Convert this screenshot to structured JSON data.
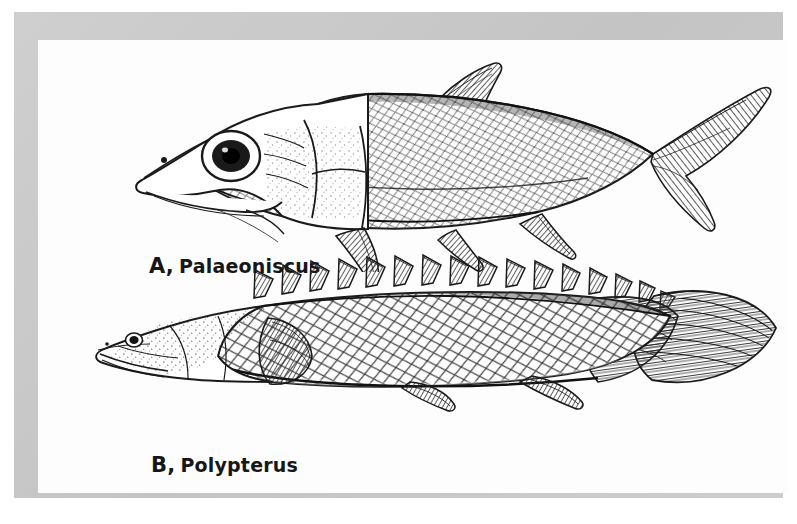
{
  "plate": {
    "background_color": "#ffffff",
    "frame_color": "#c9c9c9",
    "field_color": "#fdfdfd",
    "ink_color": "#1a1a1a"
  },
  "figures": [
    {
      "id": "A",
      "letter": "A,",
      "name": "Palaeoniscus",
      "caption": "A, Palaeoniscus",
      "description": "fusiform fossil palaeoniscoid ray-finned fish in left lateral view, heavy bony head plates, large eye, diagonal rows of rhombic ganoid scales, single pointed triangular dorsal fin, deeply forked heterocercal tail",
      "fins": [
        "pectoral-fin",
        "pelvic-fin",
        "anal-fin",
        "dorsal-fin",
        "caudal-fin"
      ]
    },
    {
      "id": "B",
      "letter": "B,",
      "name": "Polypterus",
      "caption": "B, Polypterus",
      "description": "elongate bichir in left lateral view, small eye, rhombic ganoid scales, row of about sixteen separate triangular dorsal finlets, rounded lobed caudal fin",
      "dorsal_finlet_count": 16,
      "fins": [
        "pectoral-fin",
        "pelvic-fin",
        "anal-fin",
        "dorsal-finlets",
        "caudal-fin"
      ]
    }
  ]
}
